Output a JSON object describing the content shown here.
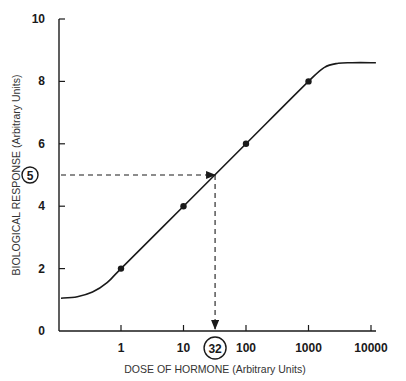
{
  "chart_data": {
    "type": "line",
    "title": "",
    "xlabel": "DOSE OF HORMONE (Arbitrary Units)",
    "ylabel": "BIOLOGICAL RESPONSE  (Arbitrary Units)",
    "x_scale": "log",
    "x_ticks": [
      "1",
      "10",
      "100",
      "1000",
      "10000"
    ],
    "x_tick_values": [
      1,
      10,
      100,
      1000,
      10000
    ],
    "y_ticks": [
      "0",
      "2",
      "4",
      "6",
      "8",
      "10"
    ],
    "y_tick_values": [
      0,
      2,
      4,
      6,
      8,
      10
    ],
    "ylim": [
      0,
      10
    ],
    "xlim": [
      0.1,
      20000
    ],
    "grid": false,
    "legend": null,
    "series": [
      {
        "name": "Dose-response curve",
        "curve_x": [
          0.1,
          0.2,
          0.35,
          0.6,
          1,
          10,
          100,
          1000,
          1800,
          3000,
          5000,
          12000
        ],
        "curve_y": [
          1.05,
          1.1,
          1.25,
          1.55,
          2,
          4,
          6,
          8,
          8.45,
          8.58,
          8.6,
          8.6
        ],
        "marked_points": {
          "x": [
            1,
            10,
            100,
            1000
          ],
          "y": [
            2,
            4,
            6,
            8
          ]
        }
      }
    ],
    "annotations": [
      {
        "type": "dashed-arrow",
        "from": {
          "x": 0.1,
          "y": 5
        },
        "to": {
          "x": 32,
          "y": 5
        }
      },
      {
        "type": "dashed-arrow",
        "from": {
          "x": 32,
          "y": 5
        },
        "to": {
          "x": 32,
          "y": 0
        }
      },
      {
        "type": "circled-label",
        "axis": "y",
        "value": 5,
        "text": "5"
      },
      {
        "type": "circled-label",
        "axis": "x",
        "value": 32,
        "text": "32"
      }
    ]
  }
}
